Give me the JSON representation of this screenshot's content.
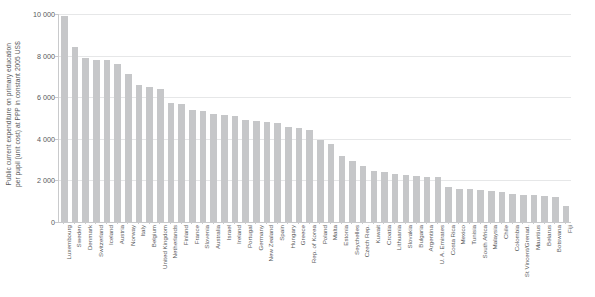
{
  "chart_data": {
    "type": "bar",
    "title": "",
    "subtitle": "",
    "xlabel": "",
    "ylabel_line1": "Public current expenditure on primary education",
    "ylabel_line2": "per pupil (unit cost) at PPP in constant 2005 US$",
    "ylim": [
      0,
      10000
    ],
    "ytick_values": [
      0,
      2000,
      4000,
      6000,
      8000,
      10000
    ],
    "ytick_labels": [
      "0",
      "2 000",
      "4 000",
      "6 000",
      "8 000",
      "10 000"
    ],
    "grid": "horizontal",
    "legend": "none",
    "bar_color": "#c6c7c9",
    "axis_color": "#c9cacc",
    "text_color": "#58595b",
    "categories": [
      "Luxembourg",
      "Sweden",
      "Denmark",
      "Switzerland",
      "Iceland",
      "Austria",
      "Norway",
      "Italy",
      "Belgium",
      "United Kingdom",
      "Netherlands",
      "Finland",
      "France",
      "Slovenia",
      "Australia",
      "Israel",
      "Ireland",
      "Portugal",
      "Germany",
      "New Zealand",
      "Spain",
      "Hungary",
      "Greece",
      "Rep. of Korea",
      "Poland",
      "Malta",
      "Estonia",
      "Seychelles",
      "Czech Rep.",
      "Kuwait",
      "Croatia",
      "Lithuania",
      "Slovakia",
      "Bulgaria",
      "Argentina",
      "U. A. Emirates",
      "Costa Rica",
      "Mexico",
      "Tunisia",
      "South Africa",
      "Malaysia",
      "Chile",
      "Colombia",
      "St Vincent/Grenad.",
      "Mauritius",
      "Belarus",
      "Botswana",
      "Fiji"
    ],
    "values": [
      9900,
      8400,
      7900,
      7800,
      7800,
      7600,
      7100,
      6600,
      6500,
      6400,
      5700,
      5650,
      5400,
      5350,
      5200,
      5150,
      5100,
      4900,
      4850,
      4800,
      4750,
      4550,
      4500,
      4400,
      3950,
      3750,
      3150,
      2950,
      2700,
      2450,
      2400,
      2300,
      2250,
      2200,
      2150,
      2150,
      1700,
      1600,
      1600,
      1550,
      1500,
      1450,
      1350,
      1300,
      1300,
      1250,
      1200,
      750
    ]
  }
}
